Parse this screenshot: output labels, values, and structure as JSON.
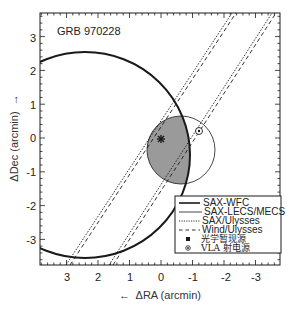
{
  "chart_data": {
    "type": "scatter",
    "title": "GRB 970228",
    "xlabel": "← ΔRA (arcmin)",
    "ylabel": "ΔDec (arcmin) →",
    "xlim": [
      3.8,
      -3.7
    ],
    "ylim": [
      -3.8,
      3.7
    ],
    "x_ticks": [
      3,
      2,
      1,
      0,
      -1,
      -2,
      -3
    ],
    "y_ticks": [
      3,
      2,
      1,
      0,
      -1,
      -2,
      -3
    ],
    "grid": false,
    "legend_position": "lower right",
    "shaded_region": "intersection of SAX-WFC circle and SAX-LECS/MECS circle (gray)",
    "series": [
      {
        "name": "SAX-WFC",
        "style": "thick solid",
        "shape": "circle",
        "center": [
          2.4,
          -0.5
        ],
        "radius": 3.0
      },
      {
        "name": "SAX-LECS/MECS",
        "style": "thin solid",
        "shape": "circle",
        "center": [
          -0.6,
          -0.35
        ],
        "radius": 1.05
      },
      {
        "name": "SAX/Ulysses",
        "style": "dotted",
        "shape": "annulus band (parallel lines)",
        "lines": [
          [
            [
              2.95,
              -3.8
            ],
            [
              -2.35,
              3.7
            ]
          ],
          [
            [
              1.55,
              -3.8
            ],
            [
              -3.6,
              3.7
            ]
          ]
        ]
      },
      {
        "name": "Wind/Ulysses",
        "style": "dashed",
        "shape": "annulus band (parallel lines)",
        "lines": [
          [
            [
              2.85,
              -3.8
            ],
            [
              -2.45,
              3.7
            ]
          ],
          [
            [
              1.45,
              -3.8
            ],
            [
              -3.7,
              3.7
            ]
          ]
        ]
      },
      {
        "name": "光学暂现源",
        "marker": "asterisk",
        "points": [
          [
            0.0,
            0.0
          ]
        ]
      },
      {
        "name": "VLA 射电源",
        "marker": "circled dot",
        "points": [
          [
            -1.2,
            0.2
          ]
        ]
      }
    ]
  },
  "title": "GRB 970228",
  "axes": {
    "x_label": "←  ΔRA (arcmin)",
    "y_label": "ΔDec (arcmin)  →",
    "x_ticks": [
      "3",
      "2",
      "1",
      "0",
      "-1",
      "-2",
      "-3"
    ],
    "y_ticks": [
      "3",
      "2",
      "1",
      "0",
      "-1",
      "-2",
      "-3"
    ]
  },
  "legend": {
    "items": [
      {
        "label": "SAX-WFC"
      },
      {
        "label": "SAX-LECS/MECS"
      },
      {
        "label": "SAX/Ulysses"
      },
      {
        "label": "Wind/Ulysses"
      },
      {
        "label": "光学暂现源"
      },
      {
        "label": "VLA 射电源"
      }
    ]
  },
  "colors": {
    "ink": "#1a1a1a",
    "shade": "#9a9a9a",
    "background": "#ffffff"
  }
}
